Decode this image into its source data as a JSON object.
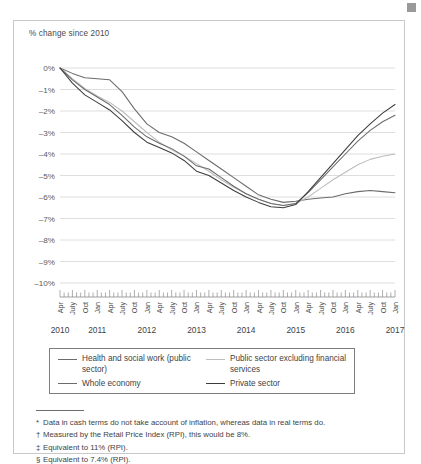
{
  "corner_mark": {
    "color": "#9a9a9a"
  },
  "figure": {
    "axis_title": "% change since 2010"
  },
  "legend": {
    "items": [
      {
        "label": "Health and social work (public sector)",
        "color": "#6b6b6b",
        "name": "legend-health-and-social-work"
      },
      {
        "label": "Public sector excluding financial services",
        "color": "#bdbdbd",
        "name": "legend-public-sector-excluding-financial-services"
      },
      {
        "label": "Whole economy",
        "color": "#6b6b6b",
        "name": "legend-whole-economy"
      },
      {
        "label": "Private sector",
        "color": "#3d3d3d",
        "name": "legend-private-sector"
      }
    ]
  },
  "footnotes": [
    {
      "mark": "*",
      "text": "Data in cash terms do not take account of inflation, whereas data in real terms do."
    },
    {
      "mark": "†",
      "text": "Measured by the Retail Price Index (RPI), this would be 8%."
    },
    {
      "mark": "‡",
      "text": "Equivalent to 11% (RPI)."
    },
    {
      "mark": "§",
      "text": "Equivalent to 7.4% (RPI)."
    }
  ],
  "chart_data": {
    "type": "line",
    "title": "",
    "xlabel": "",
    "ylabel": "% change since 2010",
    "ylim": [
      -10,
      0
    ],
    "grid": true,
    "legend_position": "bottom",
    "y_ticks": [
      "0%",
      "–1%",
      "–2%",
      "–3%",
      "–4%",
      "–5%",
      "–6%",
      "–7%",
      "–8%",
      "–9%",
      "–10%"
    ],
    "y_tick_values": [
      0,
      -1,
      -2,
      -3,
      -4,
      -5,
      -6,
      -7,
      -8,
      -9,
      -10
    ],
    "x_tick_labels": [
      "Apr",
      "July",
      "Oct",
      "Jan",
      "Apr",
      "July",
      "Oct",
      "Jan",
      "Apr",
      "July",
      "Oct",
      "Jan",
      "Apr",
      "July",
      "Oct",
      "Jan",
      "Apr",
      "July",
      "Oct",
      "Jan",
      "Apr",
      "July",
      "Oct",
      "Jan",
      "Apr",
      "July",
      "Oct",
      "Jan"
    ],
    "x_start": "Apr 2010",
    "x_end": "Jan 2017",
    "year_labels": [
      "2010",
      "2011",
      "2012",
      "2013",
      "2014",
      "2015",
      "2016",
      "2017"
    ],
    "tick_interval": "monthly",
    "label_interval": "quarterly",
    "x": [
      "Apr 2010",
      "July 2010",
      "Oct 2010",
      "Jan 2011",
      "Apr 2011",
      "July 2011",
      "Oct 2011",
      "Jan 2012",
      "Apr 2012",
      "July 2012",
      "Oct 2012",
      "Jan 2013",
      "Apr 2013",
      "July 2013",
      "Oct 2013",
      "Jan 2014",
      "Apr 2014",
      "July 2014",
      "Oct 2014",
      "Jan 2015",
      "Apr 2015",
      "July 2015",
      "Oct 2015",
      "Jan 2016",
      "Apr 2016",
      "July 2016",
      "Oct 2016",
      "Jan 2017"
    ],
    "series": [
      {
        "name": "Health and social work (public sector)",
        "color": "#6b6b6b",
        "values": [
          0,
          -0.25,
          -0.45,
          -0.5,
          -0.55,
          -1.1,
          -1.9,
          -2.6,
          -3.0,
          -3.2,
          -3.5,
          -3.9,
          -4.3,
          -4.7,
          -5.1,
          -5.5,
          -5.9,
          -6.1,
          -6.25,
          -6.2,
          -6.1,
          -6.05,
          -6.0,
          -5.85,
          -5.75,
          -5.7,
          -5.75,
          -5.8
        ]
      },
      {
        "name": "Public sector excluding financial services",
        "color": "#bdbdbd",
        "values": [
          0,
          -0.5,
          -0.95,
          -1.3,
          -1.6,
          -2.0,
          -2.5,
          -3.0,
          -3.45,
          -3.8,
          -4.1,
          -4.45,
          -4.8,
          -5.2,
          -5.55,
          -5.85,
          -6.1,
          -6.3,
          -6.4,
          -6.3,
          -6.0,
          -5.6,
          -5.2,
          -4.85,
          -4.5,
          -4.25,
          -4.1,
          -4.0
        ]
      },
      {
        "name": "Whole economy",
        "color": "#6b6b6b",
        "values": [
          0,
          -0.55,
          -1.0,
          -1.35,
          -1.7,
          -2.2,
          -2.75,
          -3.2,
          -3.5,
          -3.75,
          -4.1,
          -4.55,
          -4.7,
          -5.1,
          -5.5,
          -5.85,
          -6.1,
          -6.3,
          -6.4,
          -6.3,
          -5.8,
          -5.2,
          -4.6,
          -4.0,
          -3.4,
          -2.9,
          -2.5,
          -2.2
        ]
      },
      {
        "name": "Private sector",
        "color": "#3d3d3d",
        "values": [
          0,
          -0.7,
          -1.25,
          -1.6,
          -1.95,
          -2.45,
          -3.0,
          -3.45,
          -3.7,
          -3.95,
          -4.3,
          -4.8,
          -5.0,
          -5.35,
          -5.7,
          -6.0,
          -6.25,
          -6.45,
          -6.5,
          -6.35,
          -5.75,
          -5.1,
          -4.45,
          -3.8,
          -3.15,
          -2.6,
          -2.1,
          -1.7
        ]
      }
    ]
  }
}
